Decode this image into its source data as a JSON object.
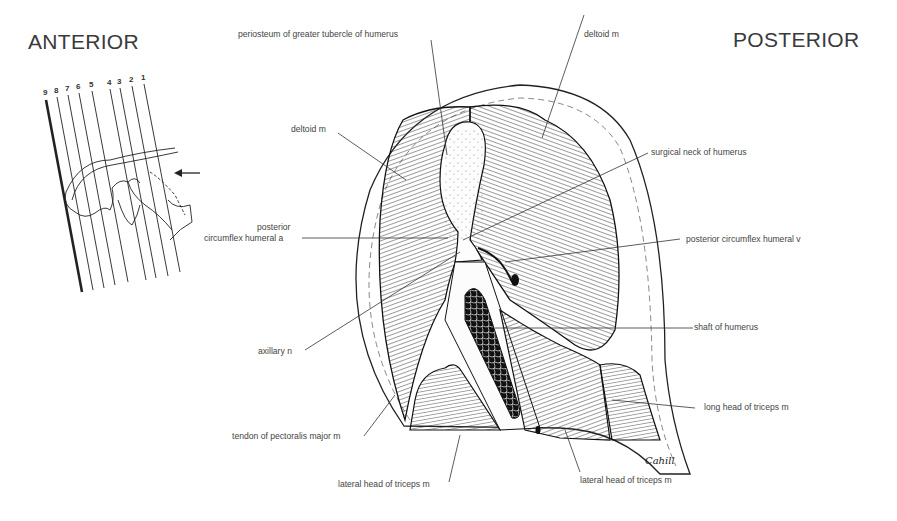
{
  "headings": {
    "anterior": "ANTERIOR",
    "posterior": "POSTERIOR"
  },
  "orientation_diagram": {
    "section_numbers": [
      "9",
      "8",
      "7",
      "6",
      "5",
      "4",
      "3",
      "2",
      "1"
    ],
    "highlighted_section": "9",
    "arrow_direction": "left"
  },
  "labels": {
    "periosteum": "periosteum of greater tubercle of humerus",
    "deltoid_top": "deltoid m",
    "deltoid_left": "deltoid m",
    "surgical_neck": "surgical neck of humerus",
    "post_circ_a_line1": "posterior",
    "post_circ_a_line2": "circumflex humeral a",
    "post_circ_v": "posterior circumflex humeral v",
    "axillary": "axillary n",
    "shaft": "shaft of humerus",
    "long_head": "long head of triceps m",
    "pectoralis": "tendon of pectoralis major m",
    "lateral_head_left": "lateral head of triceps m",
    "lateral_head_right": "lateral head of triceps m"
  },
  "signature": "Cahill"
}
